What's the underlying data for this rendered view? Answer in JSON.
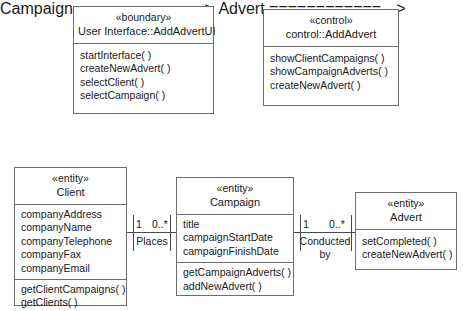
{
  "diagram": {
    "background": "#ffffff",
    "line_color": "#6e6e6e"
  },
  "classes": {
    "boundary_ui": {
      "stereotype": "«boundary»",
      "name": "User Interface::AddAdvertUI",
      "attributes": [],
      "operations": [
        "startInterface( )",
        "createNewAdvert( )",
        "selectClient( )",
        "selectCampaign( )"
      ]
    },
    "control_addadvert": {
      "stereotype": "«control»",
      "name": "control::AddAdvert",
      "attributes": [],
      "operations": [
        "showClientCampaigns( )",
        "showCampaignAdverts( )",
        "createNewAdvert( )"
      ]
    },
    "client": {
      "stereotype": "«entity»",
      "name": "Client",
      "attributes": [
        "companyAddress",
        "companyName",
        "companyTelephone",
        "companyFax",
        "companyEmail"
      ],
      "operations": [
        "getClientCampaigns( )",
        "getClients( )"
      ]
    },
    "campaign": {
      "stereotype": "«entity»",
      "name": "Campaign",
      "attributes": [
        "title",
        "campaignStartDate",
        "campaignFinishDate"
      ],
      "operations": [
        "getCampaignAdverts( )",
        "addNewAdvert( )"
      ]
    },
    "advert": {
      "stereotype": "«entity»",
      "name": "Advert",
      "attributes": [],
      "operations": [
        "setCompleted( )",
        "createNewAdvert( )"
      ]
    }
  },
  "associations": {
    "client_campaign": {
      "label": "Places",
      "source_multiplicity": "1",
      "target_multiplicity": "0..*"
    },
    "campaign_advert": {
      "label": "Conducted\nby",
      "source_multiplicity": "1",
      "target_multiplicity": "0..*"
    }
  }
}
